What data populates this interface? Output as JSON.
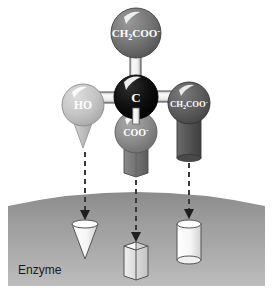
{
  "figure": {
    "background_color": "#ffffff"
  },
  "molecule": {
    "center_atom": {
      "label": "C",
      "name": "central-carbon",
      "color": "#0d0d0d",
      "cx": 136,
      "cy": 97,
      "r": 22
    },
    "substituents": [
      {
        "id": "top",
        "name": "ch2coo-top-group",
        "label_main": "CH",
        "label_sub": "2",
        "label_rest": "COO",
        "label_sup": "-",
        "color": "#6e6e6e",
        "cx": 136,
        "cy": 33,
        "r": 25,
        "shape": "none",
        "has_arrow": false
      },
      {
        "id": "left",
        "name": "ho-group",
        "label_main": "HO",
        "label_sub": "",
        "label_rest": "",
        "label_sup": "",
        "color": "#c2c2c2",
        "cx": 83,
        "cy": 105,
        "r": 21,
        "shape": "cone",
        "shape_color": "#c2c2c2",
        "has_arrow": true
      },
      {
        "id": "bottom",
        "name": "coo-group",
        "label_main": "COO",
        "label_sub": "",
        "label_rest": "",
        "label_sup": "-",
        "color": "#8a8a8a",
        "cx": 136,
        "cy": 132,
        "r": 21,
        "shape": "hex-prism",
        "shape_color": "#6f6f6f",
        "has_arrow": true
      },
      {
        "id": "right",
        "name": "ch2coo-right-group",
        "label_main": "CH",
        "label_sub": "2",
        "label_rest": "COO",
        "label_sup": "-",
        "color": "#5a5a5a",
        "cx": 189,
        "cy": 103,
        "r": 21,
        "shape": "cylinder",
        "shape_color": "#4f4f4f",
        "has_arrow": true
      }
    ]
  },
  "enzyme": {
    "label": "Enzyme",
    "surface_color_top": "#8f8f8f",
    "surface_color_bottom": "#b8b8b8",
    "binding_sites": [
      {
        "id": "site-cone",
        "name": "binding-site-cone",
        "shape": "cone",
        "x": 85,
        "y": 225,
        "fill": "#ffffff"
      },
      {
        "id": "site-hex",
        "name": "binding-site-hex-prism",
        "shape": "hex-prism",
        "x": 136,
        "y": 247,
        "fill": "#ffffff"
      },
      {
        "id": "site-cylinder",
        "name": "binding-site-cylinder",
        "shape": "cylinder",
        "x": 189,
        "y": 225,
        "fill": "#ffffff"
      }
    ]
  },
  "arrows": [
    {
      "name": "arrow-ho",
      "x": 85,
      "y1": 152,
      "y2": 217
    },
    {
      "name": "arrow-coo",
      "x": 136,
      "y1": 180,
      "y2": 238
    },
    {
      "name": "arrow-ch2coo",
      "x": 189,
      "y1": 163,
      "y2": 216
    }
  ]
}
